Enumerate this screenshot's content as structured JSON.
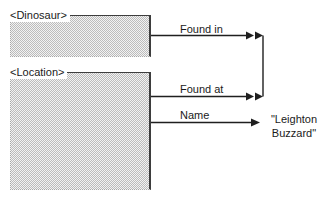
{
  "diagram": {
    "entities": [
      {
        "id": "dinosaur",
        "label": "<Dinosaur>"
      },
      {
        "id": "location",
        "label": "<Location>"
      }
    ],
    "relations": [
      {
        "label": "Found in",
        "source": "dinosaur",
        "arrowhead": "double",
        "target": "connector"
      },
      {
        "label": "Found at",
        "source": "location",
        "arrowhead": "double",
        "target": "connector"
      },
      {
        "label": "Name",
        "source": "location",
        "arrowhead": "single",
        "target": "value"
      }
    ],
    "value": {
      "lines": [
        "\"Leighton",
        "Buzzard\""
      ]
    },
    "colors": {
      "line": "#1f1f1f",
      "box_fill_dot": "#bcbcbc",
      "box_fill_base": "#f2f2f2",
      "background": "#ffffff"
    }
  }
}
